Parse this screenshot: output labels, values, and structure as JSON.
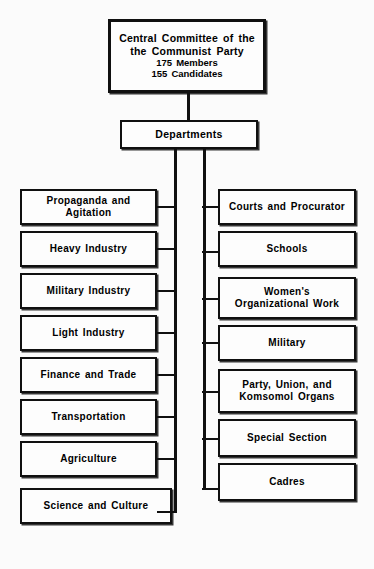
{
  "diagram": {
    "root": {
      "line1": "Central Committee of the",
      "line2": "the Communist Party",
      "line3": "175 Members",
      "line4": "155 Candidates"
    },
    "hub": {
      "label": "Departments"
    },
    "left_column": [
      {
        "label": "Propaganda and Agitation"
      },
      {
        "label": "Heavy Industry"
      },
      {
        "label": "Military Industry"
      },
      {
        "label": "Light Industry"
      },
      {
        "label": "Finance and Trade"
      },
      {
        "label": "Transportation"
      },
      {
        "label": "Agriculture"
      },
      {
        "label": "Science and Culture"
      }
    ],
    "right_column": [
      {
        "label": "Courts and Procurator"
      },
      {
        "label": "Schools"
      },
      {
        "label_line1": "Women's",
        "label_line2": "Organizational Work"
      },
      {
        "label": "Military"
      },
      {
        "label_line1": "Party, Union, and",
        "label_line2": "Komsomol Organs"
      },
      {
        "label": "Special Section"
      },
      {
        "label": "Cadres"
      }
    ],
    "colors": {
      "ink": "#101010",
      "paper": "#fbfbfb",
      "box_fill": "#fdfdfd"
    }
  }
}
